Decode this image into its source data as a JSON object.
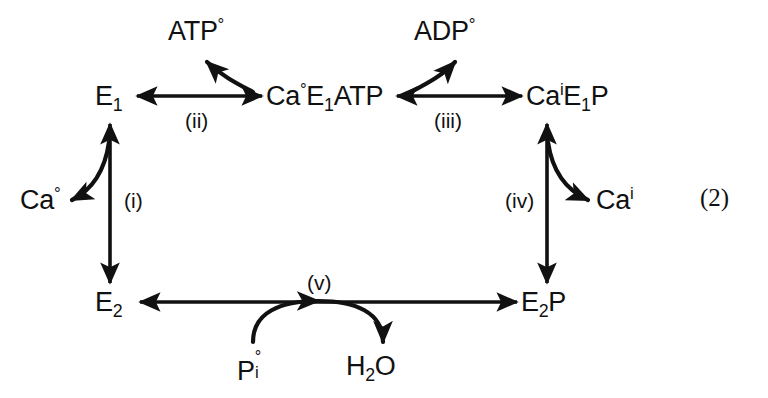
{
  "figure": {
    "kind": "reaction-cycle-diagram",
    "equation_number": "(2)",
    "stroke_color": "#111111",
    "background_color": "#ffffff"
  },
  "nodes": {
    "e1": {
      "base": "E",
      "subscript": "1",
      "full_text": "E1"
    },
    "ca_o_e1_atp": {
      "prefix": "Ca",
      "superscript": "°",
      "mid": "E",
      "subscript": "1",
      "suffix": "ATP",
      "full_text": "Ca°E1ATP"
    },
    "ca_i_e1_p": {
      "prefix": "Ca",
      "superscript": "i",
      "mid": "E",
      "subscript": "1",
      "suffix": "P",
      "full_text": "CaiE1P"
    },
    "e2": {
      "base": "E",
      "subscript": "2",
      "full_text": "E2"
    },
    "e2p": {
      "base": "E",
      "subscript": "2",
      "suffix": "P",
      "full_text": "E2P"
    }
  },
  "ligands": {
    "atp_out": {
      "base": "ATP",
      "superscript": "°",
      "full_text": "ATP°"
    },
    "adp_out": {
      "base": "ADP",
      "superscript": "°",
      "full_text": "ADP°"
    },
    "ca_out": {
      "base": "Ca",
      "superscript": "°",
      "full_text": "Ca°"
    },
    "ca_in": {
      "base": "Ca",
      "superscript": "i",
      "full_text": "Cai"
    },
    "pi_out": {
      "base": "P",
      "superscript": "°",
      "subscript": "i",
      "full_text": "Pi°"
    },
    "water": {
      "base": "H",
      "subscript": "2",
      "suffix": "O",
      "full_text": "H2O"
    }
  },
  "steps": [
    {
      "id": "i",
      "label": "(i)",
      "description": "E2 to E1 with Ca° release"
    },
    {
      "id": "ii",
      "label": "(ii)",
      "description": "E1 to Ca°E1ATP with ATP°"
    },
    {
      "id": "iii",
      "label": "(iii)",
      "description": "Ca°E1ATP to CaiE1P with ADP° release"
    },
    {
      "id": "iv",
      "label": "(iv)",
      "description": "CaiE1P to E2P with Cai release"
    },
    {
      "id": "v",
      "label": "(v)",
      "description": "E2P to E2 with Pi° and H2O"
    }
  ]
}
